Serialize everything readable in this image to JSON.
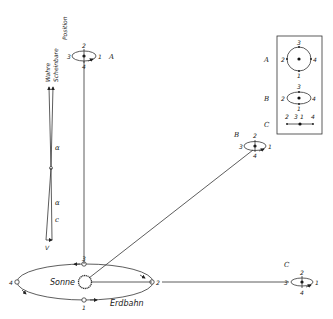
{
  "labels": {
    "position_header": "Position",
    "true_position": "Wahre",
    "apparent_position": "Scheinbare",
    "alpha_upper": "α",
    "alpha_lower": "α",
    "c_label": "c",
    "v_label": "V",
    "sun": "Sonne",
    "earth_orbit": "Erdbahn"
  },
  "orbit_points": {
    "p1": "1",
    "p2": "2",
    "p3": "3",
    "p4": "4"
  },
  "stars": [
    {
      "name": "A",
      "p1": "1",
      "p2": "2",
      "p3": "3",
      "p4": "4"
    },
    {
      "name": "B",
      "p1": "1",
      "p2": "2",
      "p3": "3",
      "p4": "4"
    },
    {
      "name": "C",
      "p1": "1",
      "p2": "2",
      "p3": "3",
      "p4": "4"
    }
  ],
  "legend_box": {
    "rows": [
      {
        "name": "A",
        "shape": "circle",
        "top": "3",
        "left": "2",
        "right": "4",
        "bottom": "1"
      },
      {
        "name": "B",
        "shape": "ellipse",
        "top": "3",
        "left": "2",
        "right": "4",
        "bottom": "1"
      },
      {
        "name": "C",
        "shape": "line",
        "order": [
          "2",
          "3",
          "1",
          "4"
        ]
      }
    ]
  }
}
